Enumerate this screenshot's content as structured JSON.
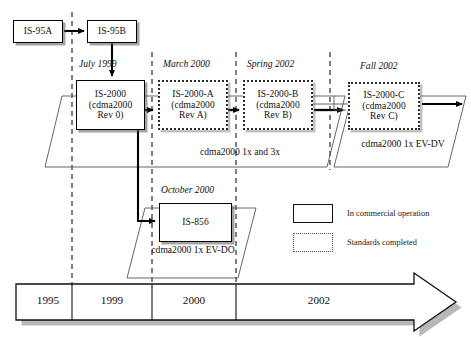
{
  "diagram": {
    "nodes": [
      {
        "id": "is95a",
        "style": "solid",
        "lines": [
          "IS-95A"
        ]
      },
      {
        "id": "is95b",
        "style": "solid",
        "lines": [
          "IS-95B"
        ]
      },
      {
        "id": "is2000",
        "style": "solid",
        "lines": [
          "IS-2000",
          "(cdma2000",
          "Rev 0)"
        ]
      },
      {
        "id": "is2000a",
        "style": "dotted",
        "lines": [
          "IS-2000-A",
          "(cdma2000",
          "Rev A)"
        ]
      },
      {
        "id": "is2000b",
        "style": "dotted",
        "lines": [
          "IS-2000-B",
          "(cdma2000",
          "Rev B)"
        ]
      },
      {
        "id": "is2000c",
        "style": "dotted",
        "lines": [
          "IS-2000-C",
          "(cdma2000",
          "Rev C)"
        ]
      },
      {
        "id": "is856",
        "style": "solid",
        "lines": [
          "IS-856"
        ]
      }
    ],
    "date_captions": [
      {
        "id": "july1999",
        "text": "July 1999"
      },
      {
        "id": "march2000",
        "text": "March 2000"
      },
      {
        "id": "spring2002",
        "text": "Spring 2002"
      },
      {
        "id": "fall2002",
        "text": "Fall 2002"
      },
      {
        "id": "october2000",
        "text": "October 2000"
      }
    ],
    "group_labels": [
      {
        "id": "onex-threex",
        "lines": [
          "cdma2000 1x and 3x"
        ]
      },
      {
        "id": "evdv",
        "lines": [
          "cdma2000",
          "1x EV-DV"
        ]
      },
      {
        "id": "evdo",
        "lines": [
          "cdma2000",
          "1x EV-DO"
        ]
      }
    ],
    "legend": {
      "items": [
        {
          "id": "commercial",
          "style": "solid",
          "label": "In commercial operation"
        },
        {
          "id": "standards",
          "style": "dotted",
          "label": "Standards completed"
        }
      ]
    },
    "timeline": {
      "years": [
        "1995",
        "1999",
        "2000",
        "2002"
      ]
    },
    "colors": {
      "background": "#ffffff",
      "stroke": "#000000",
      "dotted_stroke": "#2c2c2c",
      "shadow": "#8a8a8a",
      "guide_dash": "#333333",
      "text": "#111111"
    }
  }
}
